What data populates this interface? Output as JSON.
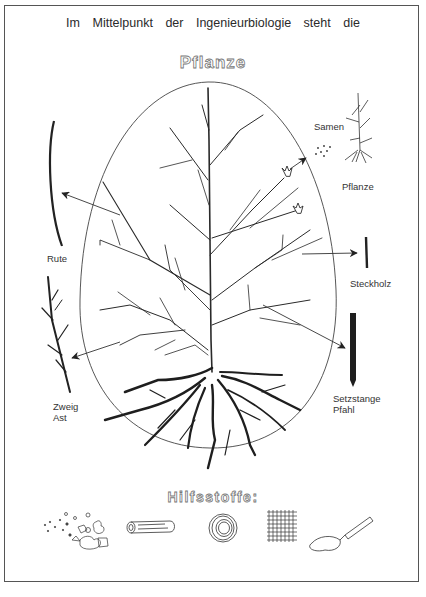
{
  "header": {
    "headline": "Im Mittelpunkt der Ingenieurbiologie steht die",
    "title": "Pflanze"
  },
  "labels": {
    "samen": "Samen",
    "pflanze": "Pflanze",
    "rute": "Rute",
    "steckholz": "Steckholz",
    "zweig": "Zweig",
    "ast": "Ast",
    "setzstange": "Setzstange",
    "pfahl": "Pfahl"
  },
  "auxiliary": {
    "title": "Hilfsstoffe:",
    "items": [
      {
        "icon": "stones-gravel-icon"
      },
      {
        "icon": "log-bundle-icon"
      },
      {
        "icon": "wire-coil-icon"
      },
      {
        "icon": "mesh-grid-icon"
      },
      {
        "icon": "tube-glue-icon"
      }
    ]
  },
  "colors": {
    "ink": "#2a2a2a",
    "frame": "#555555",
    "background": "#ffffff"
  }
}
